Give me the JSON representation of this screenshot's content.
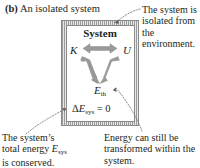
{
  "figure": {
    "caption_label": "(b)",
    "caption_text": "An isolated system",
    "box": {
      "title": "System",
      "kinetic_label": "K",
      "potential_label": "U",
      "thermal_label_base": "E",
      "thermal_label_sub": "th",
      "energy_equation_delta": "Δ",
      "energy_equation_var": "E",
      "energy_equation_sub": "sys",
      "energy_equation_rhs": "= 0"
    },
    "annotations": {
      "top_right": "The system is isolated from the environment.",
      "bottom_left_line1": "The system’s",
      "bottom_left_line2a": "total energy ",
      "bottom_left_line2b": "E",
      "bottom_left_line2sub": "sys",
      "bottom_left_line3": "is conserved.",
      "bottom_right": "Energy can still be transformed within the system."
    }
  },
  "colors": {
    "text": "#231f20",
    "arrow_gray": "#9a9a9a",
    "arrow_gray_dark": "#8b8b8b",
    "border_gray": "#8a8a8a",
    "hatch_gray": "#9b9b9b",
    "leader_gray": "#6f6f6f"
  },
  "icons": {
    "exchange_arrow": "double-headed-arrow",
    "transform_arrow_left": "down-right-arrow",
    "transform_arrow_right": "down-left-arrow",
    "leader_top": "dotted-leader-arrow",
    "leader_bottom_left": "dotted-leader-arrow",
    "leader_bottom_right": "dotted-leader-arrow"
  }
}
